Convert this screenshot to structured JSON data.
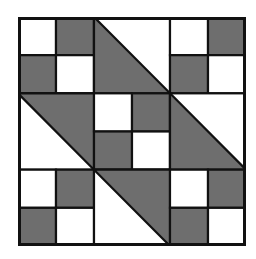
{
  "diagram": {
    "type": "quilt-block",
    "grid_size": 6,
    "colors": {
      "dark": "#6e6e6e",
      "light": "#ffffff",
      "line": "#111111"
    },
    "units": [
      {
        "row": 0,
        "col": 0,
        "kind": "four-patch",
        "cells": [
          [
            "light",
            "dark"
          ],
          [
            "dark",
            "light"
          ]
        ]
      },
      {
        "row": 0,
        "col": 1,
        "kind": "half-square-triangle",
        "diagonal": "tl-br",
        "dark_side": "lower-left"
      },
      {
        "row": 0,
        "col": 2,
        "kind": "four-patch",
        "cells": [
          [
            "light",
            "dark"
          ],
          [
            "dark",
            "light"
          ]
        ]
      },
      {
        "row": 1,
        "col": 0,
        "kind": "half-square-triangle",
        "diagonal": "tl-br",
        "dark_side": "upper-right"
      },
      {
        "row": 1,
        "col": 1,
        "kind": "four-patch",
        "cells": [
          [
            "light",
            "dark"
          ],
          [
            "dark",
            "light"
          ]
        ]
      },
      {
        "row": 1,
        "col": 2,
        "kind": "half-square-triangle",
        "diagonal": "tl-br",
        "dark_side": "lower-left"
      },
      {
        "row": 2,
        "col": 0,
        "kind": "four-patch",
        "cells": [
          [
            "light",
            "dark"
          ],
          [
            "dark",
            "light"
          ]
        ]
      },
      {
        "row": 2,
        "col": 1,
        "kind": "half-square-triangle",
        "diagonal": "tl-br",
        "dark_side": "upper-right"
      },
      {
        "row": 2,
        "col": 2,
        "kind": "four-patch",
        "cells": [
          [
            "light",
            "dark"
          ],
          [
            "dark",
            "light"
          ]
        ]
      }
    ]
  }
}
